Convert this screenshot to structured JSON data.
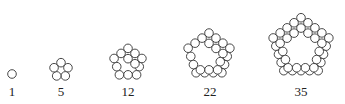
{
  "figures": [
    {
      "label": "1",
      "count": 1,
      "cx": 12,
      "cy": 74,
      "layers": 1,
      "labelX": 12
    },
    {
      "label": "5",
      "count": 5,
      "cx": 61,
      "cy": 70,
      "layers": 2,
      "labelX": 61
    },
    {
      "label": "12",
      "count": 12,
      "cx": 128,
      "cy": 63,
      "layers": 3,
      "labelX": 128
    },
    {
      "label": "22",
      "count": 22,
      "cx": 209,
      "cy": 55,
      "layers": 4,
      "labelX": 210
    },
    {
      "label": "35",
      "count": 35,
      "cx": 301,
      "cy": 47,
      "layers": 5,
      "labelX": 301
    }
  ],
  "style": {
    "stroke": "#333333",
    "fill": "#ffffff",
    "radius": 4.3
  }
}
